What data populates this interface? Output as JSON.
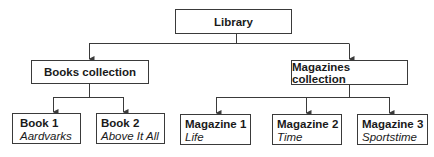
{
  "diagram": {
    "root": {
      "label": "Library"
    },
    "collections": [
      {
        "label": "Books collection"
      },
      {
        "label": "Magazines collection"
      }
    ],
    "items": [
      {
        "label": "Book 1",
        "title": "Aardvarks",
        "parent": "Books collection"
      },
      {
        "label": "Book 2",
        "title": "Above It All",
        "parent": "Books collection"
      },
      {
        "label": "Magazine 1",
        "title": "Life",
        "parent": "Magazines collection"
      },
      {
        "label": "Magazine 2",
        "title": "Time",
        "parent": "Magazines collection"
      },
      {
        "label": "Magazine 3",
        "title": "Sportstime",
        "parent": "Magazines collection"
      }
    ],
    "colors": {
      "line": "#3a3a3a",
      "background": "#ffffff",
      "text": "#1a1a1a"
    }
  }
}
